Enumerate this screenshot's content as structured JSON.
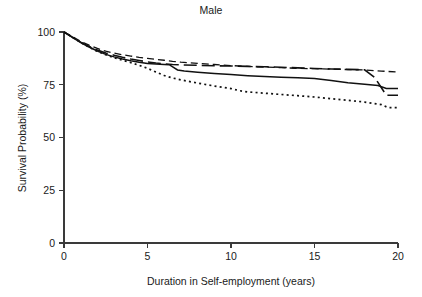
{
  "figure": {
    "title": "Male",
    "background_color": "#ffffff",
    "ink_color": "#111111"
  },
  "chart_data": {
    "type": "line",
    "title": "Male",
    "subtitle": "",
    "xlabel": "Duration in Self-employment (years)",
    "ylabel": "Survival Probability (%)",
    "xlim": [
      0,
      20
    ],
    "ylim": [
      0,
      100
    ],
    "xticks": [
      0,
      5,
      10,
      15,
      20
    ],
    "xticklabels": [
      "0",
      "5",
      "10",
      "15",
      "20"
    ],
    "yticks": [
      0,
      25,
      50,
      75,
      100
    ],
    "yticklabels": [
      "0",
      "25",
      "50",
      "75",
      "100"
    ],
    "grid": false,
    "legend": "none",
    "axis_style": "open-left-bottom",
    "series": [
      {
        "name": "short-dashed-curve",
        "linestyle": "short-dash",
        "dasharray": "7,4",
        "linewidth": 1.3,
        "color": "#111111",
        "final_value": 81,
        "x": [
          0,
          0.5,
          1,
          1.5,
          2,
          2.5,
          3,
          3.5,
          4,
          4.5,
          5,
          5.5,
          6,
          6.5,
          7,
          8,
          9,
          10,
          11,
          12,
          13,
          14,
          15,
          16,
          17,
          18,
          19,
          20
        ],
        "y": [
          100,
          97.8,
          95.6,
          93.8,
          92.2,
          90.9,
          90.0,
          89.2,
          88.6,
          88.0,
          87.5,
          87.0,
          86.6,
          86.1,
          85.7,
          85.1,
          84.6,
          84.1,
          83.7,
          83.4,
          83.1,
          82.8,
          82.6,
          82.4,
          82.2,
          82.0,
          81.5,
          81.0
        ]
      },
      {
        "name": "long-dashed-curve",
        "linestyle": "long-dash",
        "dasharray": "13,5",
        "linewidth": 1.6,
        "color": "#111111",
        "final_value": 70,
        "x": [
          0,
          0.5,
          1,
          1.5,
          2,
          2.5,
          3,
          3.5,
          4,
          4.5,
          5,
          5.5,
          6,
          6.5,
          7,
          8,
          9,
          10,
          11,
          12,
          13,
          14,
          15,
          16,
          17,
          18,
          18.6,
          19.3,
          20
        ],
        "y": [
          100,
          97.6,
          95.2,
          93.2,
          91.5,
          90.0,
          89.0,
          88.0,
          87.2,
          86.5,
          85.8,
          85.3,
          84.9,
          84.6,
          84.4,
          84.2,
          84.0,
          83.9,
          83.7,
          83.5,
          83.3,
          83.0,
          82.7,
          82.5,
          82.3,
          82.1,
          78.5,
          70.0,
          70.0
        ]
      },
      {
        "name": "solid-curve",
        "linestyle": "solid",
        "dasharray": "none",
        "linewidth": 1.5,
        "color": "#111111",
        "final_value": 73,
        "x": [
          0,
          0.5,
          1,
          1.5,
          2,
          2.5,
          3,
          3.5,
          4,
          4.5,
          5,
          5.5,
          6,
          6.3,
          6.8,
          7.2,
          8,
          9,
          10,
          11,
          12,
          13,
          14,
          15,
          16,
          17,
          18,
          18.8,
          19.3,
          20
        ],
        "y": [
          100,
          97.5,
          95.0,
          92.9,
          91.0,
          89.4,
          88.2,
          87.2,
          86.4,
          85.7,
          85.1,
          84.8,
          84.6,
          84.5,
          82.0,
          81.5,
          80.9,
          80.3,
          79.8,
          79.3,
          78.9,
          78.6,
          78.3,
          78.0,
          77.0,
          76.0,
          75.2,
          74.6,
          73.2,
          73.2
        ]
      },
      {
        "name": "dotted-curve",
        "linestyle": "dotted",
        "dasharray": "2,3.2",
        "linewidth": 1.7,
        "color": "#111111",
        "final_value": 64,
        "x": [
          0,
          0.5,
          1,
          1.5,
          2,
          2.5,
          3,
          3.5,
          4,
          4.5,
          5,
          5.5,
          6,
          6.5,
          7,
          8,
          9,
          10,
          10.5,
          11,
          12,
          13,
          14,
          15,
          16,
          17,
          18,
          19,
          19.4,
          20
        ],
        "y": [
          100,
          97.5,
          95.0,
          92.8,
          90.8,
          89.2,
          87.8,
          86.6,
          85.5,
          84.2,
          82.8,
          81.0,
          79.4,
          78.2,
          77.3,
          75.8,
          74.4,
          73.2,
          72.2,
          71.6,
          71.0,
          70.4,
          69.8,
          69.2,
          68.4,
          67.6,
          66.8,
          65.6,
          64.2,
          64.2
        ]
      }
    ]
  },
  "layout": {
    "plot_left_px": 64,
    "plot_right_px": 398,
    "plot_top_px": 32,
    "plot_bottom_px": 243,
    "title_x_px": 211,
    "title_y_px": 14,
    "xlabel_x_px": 231,
    "xlabel_y_px": 285,
    "ylabel_x_px": 26,
    "ylabel_y_px": 138
  }
}
